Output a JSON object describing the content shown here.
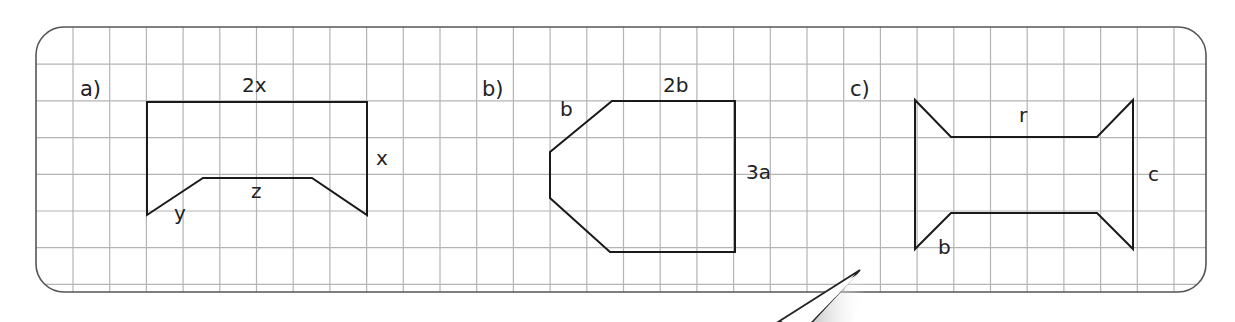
{
  "colors": {
    "background": "#ffffff",
    "grid_line": "#b4b4b4",
    "frame": "#555555",
    "shape_stroke": "#1a1a1a",
    "text": "#222222"
  },
  "grid": {
    "frame": {
      "x": 36,
      "y": 27,
      "width": 1170,
      "height": 265,
      "radius": 28
    },
    "cell_size": 36.7,
    "origin_x": 36.3,
    "origin_y": 27.5
  },
  "figures": [
    {
      "id": "a",
      "part_label": "a)",
      "part_label_pos": [
        80,
        101
      ],
      "points": [
        [
          147,
          102
        ],
        [
          367,
          102
        ],
        [
          367,
          215
        ],
        [
          312,
          178
        ],
        [
          203,
          178
        ],
        [
          147,
          215
        ]
      ],
      "edge_labels": [
        {
          "text": "2x",
          "pos": [
            242,
            77
          ]
        },
        {
          "text": "x",
          "pos": [
            376,
            150
          ]
        },
        {
          "text": "z",
          "pos": [
            251,
            183
          ]
        },
        {
          "text": "y",
          "pos": [
            174,
            205
          ]
        }
      ]
    },
    {
      "id": "b",
      "part_label": "b)",
      "part_label_pos": [
        482,
        101
      ],
      "points": [
        [
          612,
          101
        ],
        [
          735,
          101
        ],
        [
          735,
          252
        ],
        [
          610,
          252
        ],
        [
          550,
          198
        ],
        [
          550,
          152
        ]
      ],
      "edge_labels": [
        {
          "text": "2b",
          "pos": [
            663,
            77
          ]
        },
        {
          "text": "b",
          "pos": [
            560,
            101
          ]
        },
        {
          "text": "3a",
          "pos": [
            746,
            164
          ]
        }
      ]
    },
    {
      "id": "c",
      "part_label": "c)",
      "part_label_pos": [
        850,
        101
      ],
      "points": [
        [
          915,
          100
        ],
        [
          951,
          137
        ],
        [
          1097,
          137
        ],
        [
          1133,
          100
        ],
        [
          1133,
          249
        ],
        [
          1097,
          213
        ],
        [
          951,
          213
        ],
        [
          915,
          249
        ]
      ],
      "edge_labels": [
        {
          "text": "r",
          "pos": [
            1019,
            107
          ]
        },
        {
          "text": "c",
          "pos": [
            1148,
            166
          ]
        },
        {
          "text": "b",
          "pos": [
            938,
            239
          ]
        }
      ]
    }
  ],
  "pointer": {
    "tip": [
      860,
      270
    ],
    "base_left": [
      778,
      322
    ],
    "base_right": [
      812,
      322
    ]
  }
}
